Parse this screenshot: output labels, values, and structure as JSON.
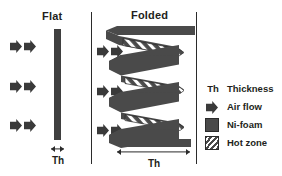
{
  "figure": {
    "panels": [
      {
        "id": "flat",
        "title": "Flat"
      },
      {
        "id": "folded",
        "title": "Folded"
      }
    ],
    "dimensions": [
      {
        "id": "flat-thickness",
        "label": "Th"
      },
      {
        "id": "folded-thickness",
        "label": "Th"
      }
    ]
  },
  "legend": {
    "items": [
      {
        "key": "Th",
        "key_icon": "th-text",
        "label": "Thickness"
      },
      {
        "key": "",
        "key_icon": "air-flow-arrow",
        "label": "Air flow"
      },
      {
        "key": "",
        "key_icon": "solid-square",
        "label": "Ni-foam"
      },
      {
        "key": "",
        "key_icon": "hatched-square",
        "label": "Hot zone"
      }
    ]
  },
  "colors": {
    "ink": "#231f20",
    "foam": "#3f3f3f",
    "band": "#4a4a4a",
    "outline": "#2b2b2b",
    "arrow": "#3a3a3a",
    "background": "#ffffff"
  }
}
